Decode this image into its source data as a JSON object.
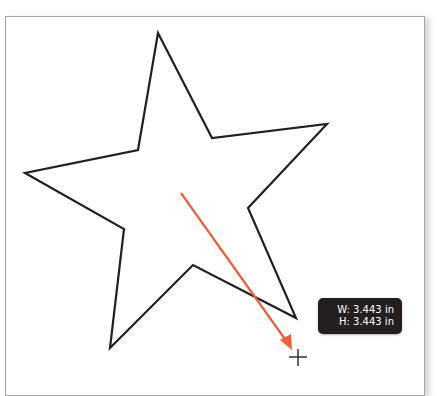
{
  "canvas": {
    "shape": {
      "type": "star",
      "stroke_color": "#231f20",
      "fill_color": "none",
      "points": [
        [
          158,
          33
        ],
        [
          212,
          138
        ],
        [
          327,
          124
        ],
        [
          248,
          208
        ],
        [
          296,
          318
        ],
        [
          193,
          265
        ],
        [
          110,
          348
        ],
        [
          124,
          229
        ],
        [
          25,
          173
        ],
        [
          138,
          150
        ]
      ]
    },
    "drag_arrow": {
      "color": "#e8603c",
      "from": [
        181,
        193
      ],
      "to": [
        290,
        347
      ]
    },
    "cursor": {
      "icon": "crosshair-icon",
      "position": [
        298,
        357
      ]
    }
  },
  "tooltip": {
    "width_label": "W: 3.443 in",
    "height_label": "H: 3.443 in"
  }
}
